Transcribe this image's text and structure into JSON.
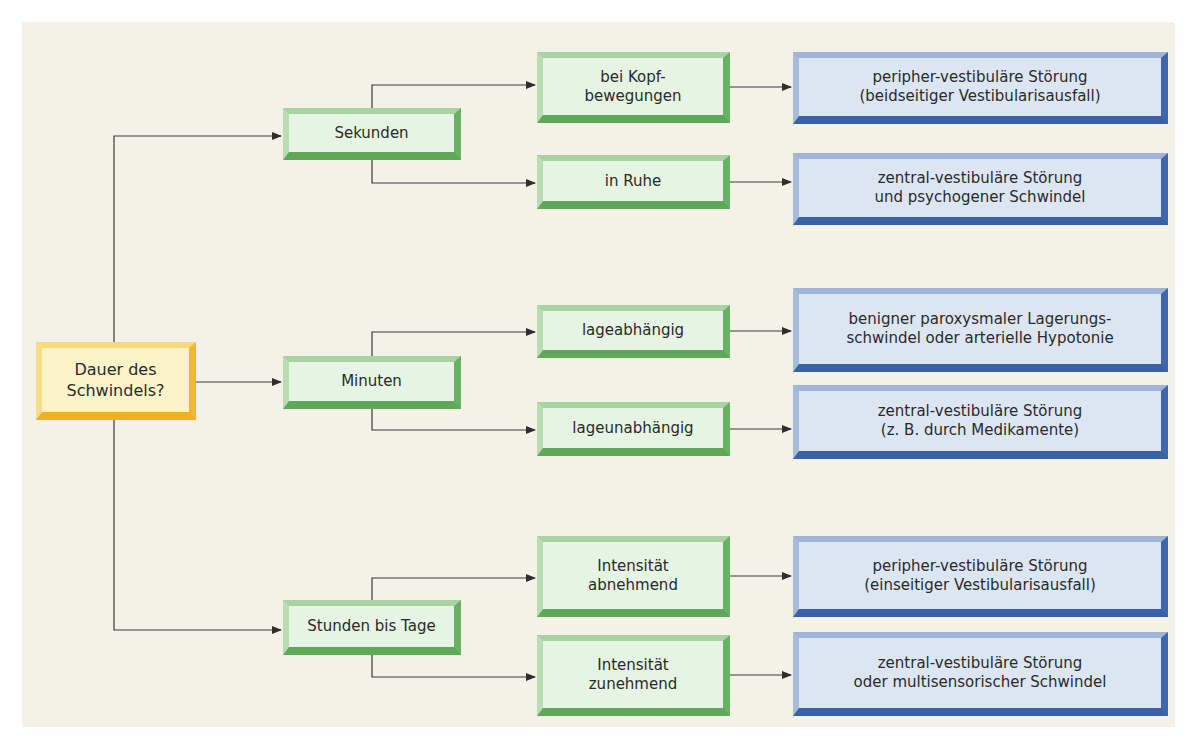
{
  "diagram": {
    "type": "decision-flowchart",
    "colors": {
      "background": "#f4f1e7",
      "root_box": "#fdf3c8",
      "root_border": "#f3b72e",
      "decision_box": "#e6f4e3",
      "decision_border": "#6ab263",
      "result_box": "#dce6f3",
      "result_border": "#3f67ab",
      "connector": "#3a3a3a"
    },
    "root": {
      "label": "Dauer des\nSchwindels?"
    },
    "branches": [
      {
        "label": "Sekunden",
        "children": [
          {
            "label": "bei Kopf-\nbewegungen",
            "result": "peripher-vestibuläre Störung\n(beidseitiger Vestibularisausfall)"
          },
          {
            "label": "in Ruhe",
            "result": "zentral-vestibuläre Störung\nund psychogener Schwindel"
          }
        ]
      },
      {
        "label": "Minuten",
        "children": [
          {
            "label": "lageabhängig",
            "result": "benigner paroxysmaler Lagerungs-\nschwindel oder arterielle Hypotonie"
          },
          {
            "label": "lageunabhängig",
            "result": "zentral-vestibuläre Störung\n(z. B. durch Medikamente)"
          }
        ]
      },
      {
        "label": "Stunden bis Tage",
        "children": [
          {
            "label": "Intensität\nabnehmend",
            "result": "peripher-vestibuläre Störung\n(einseitiger Vestibularisausfall)"
          },
          {
            "label": "Intensität\nzunehmend",
            "result": "zentral-vestibuläre Störung\noder multisensorischer Schwindel"
          }
        ]
      }
    ]
  }
}
